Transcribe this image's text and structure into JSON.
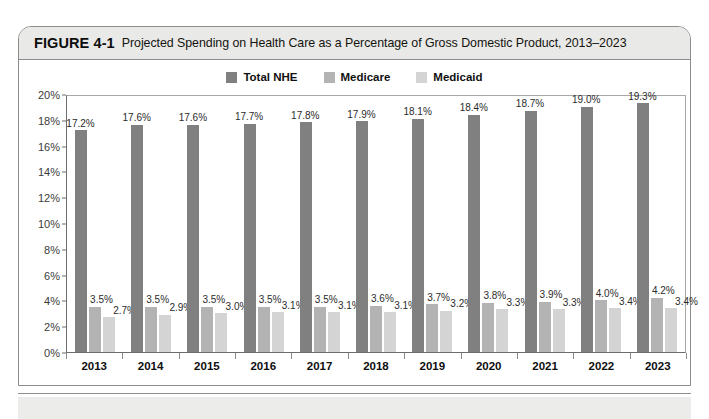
{
  "figure": {
    "label": "FIGURE 4-1",
    "caption": "Projected Spending on Health Care as a Percentage of Gross Domestic Product, 2013–2023"
  },
  "colors": {
    "total_nhe": "#808080",
    "medicare": "#b3b3b3",
    "medicaid": "#d4d4d4",
    "caption_band": "#e9e9e7",
    "frame": "#8c8c8c",
    "axis": "#6d6d6d"
  },
  "chart_data": {
    "type": "bar",
    "title": "Projected Spending on Health Care as a Percentage of Gross Domestic Product, 2013–2023",
    "xlabel": "",
    "ylabel": "",
    "ylim": [
      0,
      20
    ],
    "grid": false,
    "legend_position": "top-center",
    "ytick_labels": [
      "20%",
      "18%",
      "16%",
      "14%",
      "12%",
      "10%",
      "8%",
      "6%",
      "4%",
      "2%",
      "0%"
    ],
    "ytick_values": [
      20,
      18,
      16,
      14,
      12,
      10,
      8,
      6,
      4,
      2,
      0
    ],
    "categories": [
      "2013",
      "2014",
      "2015",
      "2016",
      "2017",
      "2018",
      "2019",
      "2020",
      "2021",
      "2022",
      "2023"
    ],
    "series": [
      {
        "name": "Total NHE",
        "color": "#808080",
        "values": [
          17.2,
          17.6,
          17.6,
          17.7,
          17.8,
          17.9,
          18.1,
          18.4,
          18.7,
          19.0,
          19.3
        ],
        "labels": [
          "17.2%",
          "17.6%",
          "17.6%",
          "17.7%",
          "17.8%",
          "17.9%",
          "18.1%",
          "18.4%",
          "18.7%",
          "19.0%",
          "19.3%"
        ]
      },
      {
        "name": "Medicare",
        "color": "#b3b3b3",
        "values": [
          3.5,
          3.5,
          3.5,
          3.5,
          3.5,
          3.6,
          3.7,
          3.8,
          3.9,
          4.0,
          4.2
        ],
        "labels": [
          "3.5%",
          "3.5%",
          "3.5%",
          "3.5%",
          "3.5%",
          "3.6%",
          "3.7%",
          "3.8%",
          "3.9%",
          "4.0%",
          "4.2%"
        ]
      },
      {
        "name": "Medicaid",
        "color": "#d4d4d4",
        "values": [
          2.7,
          2.9,
          3.0,
          3.1,
          3.1,
          3.1,
          3.2,
          3.3,
          3.3,
          3.4,
          3.4
        ],
        "labels": [
          "2.7%",
          "2.9%",
          "3.0%",
          "3.1%",
          "3.1%",
          "3.1%",
          "3.2%",
          "3.3%",
          "3.3%",
          "3.4%",
          "3.4%"
        ]
      }
    ]
  }
}
